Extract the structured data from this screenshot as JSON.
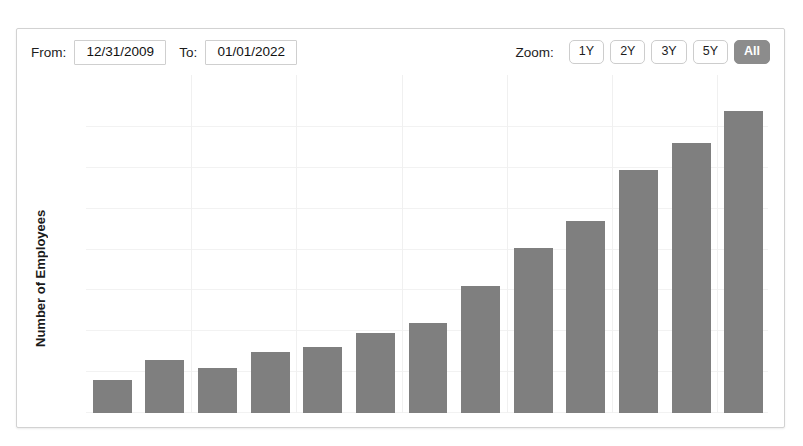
{
  "toolbar": {
    "from_label": "From:",
    "from_value": "12/31/2009",
    "to_label": "To:",
    "to_value": "01/01/2022",
    "zoom_label": "Zoom:",
    "zoom_options": [
      {
        "label": "1Y",
        "active": false
      },
      {
        "label": "2Y",
        "active": false
      },
      {
        "label": "3Y",
        "active": false
      },
      {
        "label": "5Y",
        "active": false
      },
      {
        "label": "All",
        "active": true
      }
    ]
  },
  "colors": {
    "bar": "#7f7f7f",
    "active_button": "#8c8c8c",
    "grid": "#f1f1f1",
    "panel_border": "#d2d2d2"
  },
  "chart_data": {
    "type": "bar",
    "title": "",
    "xlabel": "",
    "ylabel": "Number of Employees",
    "ylim": [
      9000,
      16800
    ],
    "yticks": [
      9000,
      10000,
      11000,
      12000,
      13000,
      14000,
      15000,
      16000
    ],
    "ytick_labels": [
      "9,000",
      "10,000",
      "11,000",
      "12,000",
      "13,000",
      "14,000",
      "15,000",
      "16,000"
    ],
    "grid": true,
    "legend": null,
    "x_axis_visible_labels": false,
    "categories": [
      "2009",
      "2010",
      "2011",
      "2012",
      "2013",
      "2014",
      "2015",
      "2016",
      "2017",
      "2018",
      "2019",
      "2020",
      "2021"
    ],
    "values": [
      9800,
      10300,
      10100,
      10500,
      10620,
      10950,
      11200,
      12100,
      13050,
      13700,
      14950,
      15600,
      16400
    ]
  }
}
